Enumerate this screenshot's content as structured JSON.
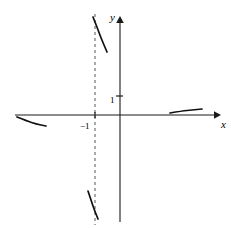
{
  "chart_data": {
    "type": "line",
    "title": "",
    "xlabel": "x",
    "ylabel": "y",
    "grid": false,
    "legend_position": "none",
    "xlim": [
      -5.2,
      5.0
    ],
    "ylim": [
      -5.6,
      5.2
    ],
    "axes": {
      "x_axis_label": "x",
      "y_axis_label": "y",
      "origin_x_px": 120,
      "origin_y_px": 115,
      "x_axis_start_px": 15,
      "x_axis_end_px": 220,
      "y_axis_top_px": 16,
      "y_axis_bottom_px": 222
    },
    "tick_labels": {
      "y_ticks": [
        "1"
      ],
      "x_ticks": [
        "−1"
      ]
    },
    "annotations": [
      {
        "text": "1",
        "axis": "y",
        "value": 1
      },
      {
        "text": "−1",
        "axis": "x",
        "value": -1
      }
    ],
    "asymptotes": [
      {
        "type": "vertical",
        "value": -1,
        "style": "dashed",
        "label": "−1"
      }
    ],
    "series": [
      {
        "name": "branch-upper-near-asymptote",
        "description": "steep branch descending just right of the vertical asymptote, above the x-axis",
        "points_px": [
          [
            93,
            17
          ],
          [
            97,
            27
          ],
          [
            101,
            38
          ],
          [
            107,
            52
          ]
        ]
      },
      {
        "name": "branch-left-outer",
        "description": "shallow branch below the x-axis on the far left, approaching the x-axis",
        "points_px": [
          [
            17,
            117
          ],
          [
            27,
            121
          ],
          [
            36,
            124
          ],
          [
            46,
            126
          ]
        ]
      },
      {
        "name": "branch-right-outer",
        "description": "shallow branch above the x-axis on the right, approaching the x-axis",
        "points_px": [
          [
            170,
            113
          ],
          [
            182,
            111
          ],
          [
            192,
            110
          ],
          [
            202,
            109
          ]
        ]
      },
      {
        "name": "branch-lower-near-asymptote",
        "description": "steep branch descending just left of the vertical asymptote, below the x-axis",
        "points_px": [
          [
            88,
            191
          ],
          [
            91,
            200
          ],
          [
            94,
            209
          ],
          [
            98,
            219
          ]
        ]
      }
    ]
  },
  "labels": {
    "y_axis": "y",
    "x_axis": "x",
    "y_tick_one": "1",
    "x_tick_minus_one": "−1"
  },
  "colors": {
    "axis": "#1a1a1a",
    "curve": "#111111",
    "asymptote": "#555555",
    "background": "#ffffff"
  }
}
